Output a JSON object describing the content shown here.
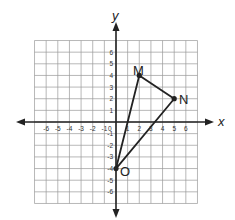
{
  "chart_data": {
    "type": "scatter",
    "title": "",
    "xlabel": "x",
    "ylabel": "y",
    "xlim": [
      -7,
      7
    ],
    "ylim": [
      -7,
      7
    ],
    "grid": true,
    "x_ticks": [
      "-6",
      "-5",
      "-4",
      "-3",
      "-2",
      "-1",
      "0",
      "1",
      "2",
      "3",
      "4",
      "5",
      "6"
    ],
    "y_ticks": [
      "6",
      "5",
      "4",
      "3",
      "2",
      "1",
      "-1",
      "-2",
      "-3",
      "-4",
      "-5",
      "-6"
    ],
    "shape": "triangle",
    "points": [
      {
        "label": "M",
        "x": 2,
        "y": 4
      },
      {
        "label": "N",
        "x": 5,
        "y": 2
      },
      {
        "label": "O",
        "x": 0,
        "y": -4
      }
    ]
  },
  "labels": {
    "x_axis": "x",
    "y_axis": "y",
    "M": "M",
    "N": "N",
    "O": "O"
  },
  "colors": {
    "grid": "#9a9a9a",
    "axis": "#222222",
    "triangle": "#222222"
  }
}
